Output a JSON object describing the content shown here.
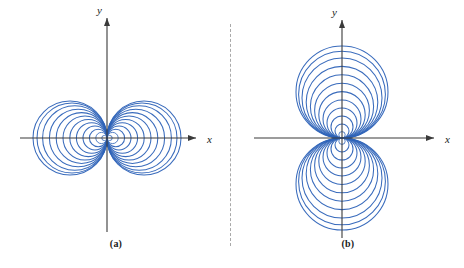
{
  "figure": {
    "width": 464,
    "height": 268,
    "background": "#ffffff",
    "curve_color": "#2e63b8",
    "axis_color": "#3a3a3a",
    "divider_color": "#a9a9a9",
    "label_color": "#1a1a1a"
  },
  "panels": [
    {
      "id": "a",
      "caption": "(a)",
      "x_axis_label": "x",
      "y_axis_label": "y",
      "origin": {
        "x": 107,
        "y": 138
      },
      "x_axis": {
        "start": 20,
        "end": 196
      },
      "y_axis": {
        "start": 232,
        "end": 18
      },
      "description": "family of circles tangent to the y-axis at the origin",
      "equation": "r = a cos(theta)"
    },
    {
      "id": "b",
      "caption": "(b)",
      "x_axis_label": "x",
      "y_axis_label": "y",
      "origin": {
        "x": 110,
        "y": 138
      },
      "x_axis": {
        "start": 22,
        "end": 202
      },
      "y_axis": {
        "start": 238,
        "end": 20
      },
      "description": "family of circles tangent to the x-axis at the origin",
      "equation": "r = a sin(theta)"
    }
  ],
  "divider": {
    "orientation": "vertical",
    "style": "dashed",
    "x": 230,
    "y_start": 24,
    "y_end": 246
  },
  "chart_data": {
    "type": "line",
    "title": "",
    "xlabel": "x",
    "ylabel": "y",
    "grid": false,
    "legend": false,
    "panels": [
      {
        "id": "a",
        "label": "(a)",
        "family": "r = a cos(theta)",
        "geometry": "circles tangent to y-axis at origin, centers on x-axis",
        "axis_ranges": {
          "x": [
            -40,
            50
          ],
          "y": [
            -45,
            45
          ]
        },
        "series": [
          {
            "name": "right-lobe",
            "center_sign": 1,
            "radii": [
              2.6,
              5.6,
              8.8,
              12.0,
              15.3,
              18.6,
              22.0,
              25.4,
              28.8,
              32.2,
              35.0,
              37.0
            ]
          },
          {
            "name": "left-lobe",
            "center_sign": -1,
            "radii": [
              2.6,
              5.6,
              8.8,
              12.0,
              15.3,
              18.6,
              22.0,
              25.4,
              28.8,
              32.2,
              35.0,
              37.0
            ]
          }
        ]
      },
      {
        "id": "b",
        "label": "(b)",
        "family": "r = a sin(theta)",
        "geometry": "circles tangent to x-axis at origin, centers on y-axis",
        "axis_ranges": {
          "x": [
            -50,
            55
          ],
          "y": [
            -50,
            50
          ]
        },
        "series": [
          {
            "name": "upper-lobe",
            "center_sign": 1,
            "radii": [
              3.2,
              7.0,
              11.0,
              15.0,
              19.0,
              23.2,
              27.4,
              31.6,
              35.8,
              40.0,
              43.4,
              46.0
            ]
          },
          {
            "name": "lower-lobe",
            "center_sign": -1,
            "radii": [
              3.2,
              7.0,
              11.0,
              15.0,
              19.0,
              23.2,
              27.4,
              31.6,
              35.8,
              40.0,
              43.4,
              46.0
            ]
          }
        ]
      }
    ]
  }
}
